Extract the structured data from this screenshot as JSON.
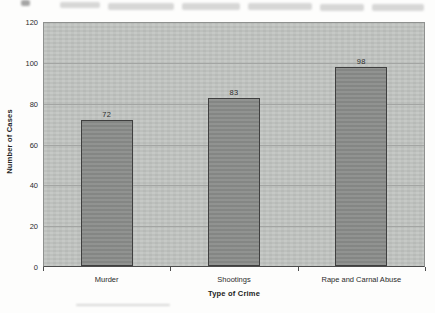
{
  "chart_data": {
    "type": "bar",
    "title": "",
    "categories": [
      "Murder",
      "Shootings",
      "Rape and Carnal Abuse"
    ],
    "values": [
      72,
      83,
      98
    ],
    "bar_labels": [
      "72",
      "83",
      "98"
    ],
    "xlabel": "Type of Crime",
    "ylabel": "Number of Cases",
    "ylim": [
      0,
      120
    ],
    "yticks": [
      0,
      20,
      40,
      60,
      80,
      100,
      120
    ],
    "grid": true,
    "legend": "none",
    "colors": {
      "plot_background": "#c1c4c1",
      "bar_fill": "#8b8d8b",
      "bar_border": "#3f3f3f",
      "gridline": "#a3a5a3",
      "axis_line": "#4c4c4c",
      "label_text": "#2b2b2b"
    }
  },
  "artifacts": {
    "top_edge_text": "cut-off illegible bleed-through text from scanned page",
    "bottom_edge_mark": "faint horizontal smudge from scanned page"
  }
}
